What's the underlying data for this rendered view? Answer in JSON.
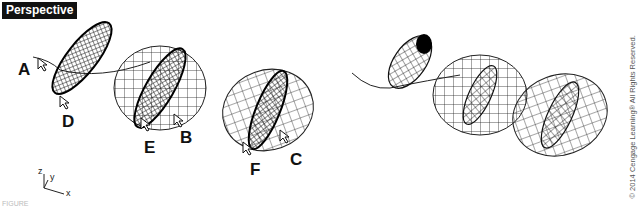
{
  "viewport": {
    "label": "Perspective"
  },
  "callouts": [
    {
      "letter": "A",
      "x": 20,
      "y": 60
    },
    {
      "letter": "D",
      "x": 64,
      "y": 95
    },
    {
      "letter": "E",
      "x": 148,
      "y": 112
    },
    {
      "letter": "B",
      "x": 182,
      "y": 100
    },
    {
      "letter": "F",
      "x": 252,
      "y": 132
    },
    {
      "letter": "C",
      "x": 292,
      "y": 120
    }
  ],
  "axes": {
    "z": "z",
    "y": "y",
    "x": "x"
  },
  "copyright": "© 2014 Cengage Learning® All Rights Reserved.",
  "caption": "FIGURE"
}
